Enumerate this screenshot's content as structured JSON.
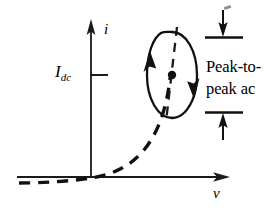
{
  "figure": {
    "background_color": "#ffffff",
    "ink_color": "#000000",
    "width": 272,
    "height": 214
  },
  "axes": {
    "vertical": {
      "label": "i",
      "icon": "up-arrow-axis",
      "x": 91,
      "y_top": 22,
      "y_bottom": 178
    },
    "horizontal": {
      "label": "v",
      "icon": "right-arrow-axis",
      "y": 177,
      "x_left": 17,
      "x_right": 228
    },
    "origin": {
      "x": 91,
      "y": 177
    }
  },
  "tick": {
    "name": "idc-tick",
    "label_main": "I",
    "label_sub": "dc",
    "y": 75,
    "x_start": 91,
    "x_end": 107
  },
  "curve": {
    "name": "diode-iv-curve",
    "style": "dashed",
    "dash_pattern": "11 8",
    "stroke_width": 3.4,
    "description": "exponential diode characteristic rising steeply above the origin"
  },
  "operating_ellipse": {
    "name": "ac-swing-ellipse",
    "center_x": 172,
    "center_y": 75,
    "radius_x": 25,
    "radius_y": 43,
    "rotation_deg": 0,
    "stroke_width": 2.2,
    "dot_radius": 4,
    "arrow_up_side": "left",
    "arrow_down_side": "right",
    "inner_dashed_line": true
  },
  "dimension": {
    "name": "peak-to-peak-dimension",
    "top_tick_y": 36,
    "bottom_tick_y": 115,
    "tick_x_start": 204,
    "tick_x_end": 243,
    "arrow_x": 223,
    "top_arrow_direction": "down",
    "bottom_arrow_direction": "up"
  },
  "annotation": {
    "name": "peak-to-peak-ac-label",
    "line1": "Peak-to-",
    "line2": "peak ac"
  },
  "artifact": {
    "name": "scan-speck",
    "visible": true
  }
}
